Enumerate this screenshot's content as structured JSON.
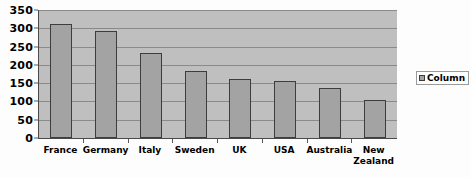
{
  "chart_data": {
    "type": "bar",
    "title": "",
    "subtitle": "",
    "xlabel": "",
    "ylabel": "",
    "categories": [
      "France",
      "Germany",
      "Italy",
      "Sweden",
      "UK",
      "USA",
      "Australia",
      "New Zealand"
    ],
    "values": [
      313,
      292,
      233,
      183,
      161,
      156,
      138,
      105
    ],
    "series": [
      {
        "name": "Column",
        "values": [
          313,
          292,
          233,
          183,
          161,
          156,
          138,
          105
        ]
      }
    ],
    "ylim": [
      0,
      350
    ],
    "y_ticks": [
      0,
      50,
      100,
      150,
      200,
      250,
      300,
      350
    ],
    "y_tick_labels": [
      "0",
      "50",
      "100",
      "150",
      "200",
      "250",
      "300",
      "350"
    ],
    "grid": true,
    "grid_axis": "y",
    "legend": {
      "position": "right",
      "entries": [
        "Column"
      ]
    },
    "colors": {
      "bar_fill": "#a3a3a3",
      "bar_border": "#3d3d3d",
      "plot_background": "#bfbfbf",
      "gridline": "#8a8a8a",
      "axis": "#4a4a4a",
      "text": "#000000",
      "page_background": "#fdfdfd"
    }
  },
  "legend": {
    "swatch_icon": "legend-swatch-icon",
    "label": "Column"
  }
}
